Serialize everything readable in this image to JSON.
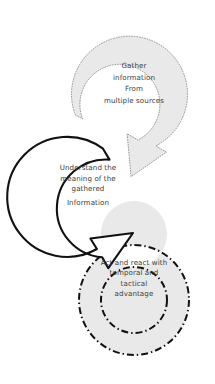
{
  "diagram": {
    "background_color": "#ffffff",
    "text_color": "#3c3c3c",
    "fill_gray": "#e9e9e9",
    "outline_gray": "#8c8c8c",
    "outline_black": "#111111",
    "stages": [
      {
        "id": "gather",
        "shape_name": "gray-dotted-circular-arrow",
        "fill": "#e9e9e9",
        "stroke": "#8c8c8c",
        "stroke_style": "dotted",
        "lines": [
          "Gather",
          "information",
          "From",
          "multiple sources"
        ]
      },
      {
        "id": "understand",
        "shape_name": "black-outline-circular-arrow",
        "fill": "#ffffff",
        "stroke": "#111111",
        "stroke_style": "solid",
        "lines": [
          "Understand the",
          "meaning of the",
          "gathered",
          "Information"
        ]
      },
      {
        "id": "act",
        "shape_name": "gray-dashdot-ring",
        "fill": "#e9e9e9",
        "stroke": "#111111",
        "stroke_style": "dash-dot",
        "lines": [
          "Act and react with",
          "temporal and",
          "tactical",
          "advantage"
        ]
      }
    ]
  }
}
